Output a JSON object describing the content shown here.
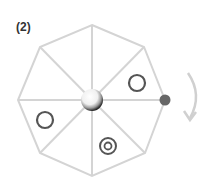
{
  "figure": {
    "label": "(2)",
    "shape": "octagon",
    "colors": {
      "lines": "#d4d4d4",
      "symbols": "#555555",
      "dot": "#666666",
      "arrow": "#d0d0d0"
    },
    "elements": [
      "center-sphere",
      "circle-upper-right",
      "circle-left",
      "target-bottom",
      "dot-right",
      "rotation-arrow-clockwise"
    ]
  }
}
